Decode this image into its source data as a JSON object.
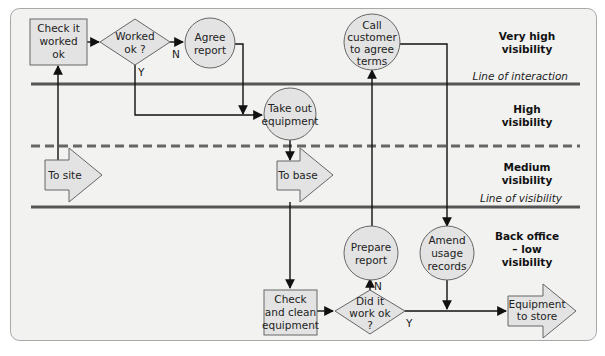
{
  "colors": {
    "panel_bg": "#f2f2f1",
    "panel_border": "#a8a8a8",
    "shape_fill": "#e3e3e3",
    "shape_stroke": "#666666",
    "line": "#555555",
    "connector": "#111111"
  },
  "zones": [
    {
      "id": "very-high",
      "lines": [
        "Very high",
        "visibility"
      ]
    },
    {
      "id": "high",
      "lines": [
        "High",
        "visibility"
      ]
    },
    {
      "id": "medium",
      "lines": [
        "Medium",
        "visibility"
      ]
    },
    {
      "id": "back-office",
      "lines": [
        "Back office",
        "– low",
        "visibility"
      ]
    }
  ],
  "boundaries": {
    "interaction": "Line of interaction",
    "visibility": "Line of visibility"
  },
  "nodes": {
    "check_worked": {
      "shape": "box",
      "lines": [
        "Check it",
        "worked",
        "ok"
      ]
    },
    "worked_ok": {
      "shape": "diamond",
      "lines": [
        "Worked",
        "ok ?"
      ]
    },
    "agree_report": {
      "shape": "circle",
      "lines": [
        "Agree",
        "report"
      ]
    },
    "call_customer": {
      "shape": "circle",
      "lines": [
        "Call",
        "customer",
        "to agree",
        "terms"
      ]
    },
    "take_out": {
      "shape": "circle",
      "lines": [
        "Take out",
        "equipment"
      ]
    },
    "to_site": {
      "shape": "arrow",
      "lines": [
        "To site"
      ]
    },
    "to_base": {
      "shape": "arrow",
      "lines": [
        "To base"
      ]
    },
    "prepare_report": {
      "shape": "circle",
      "lines": [
        "Prepare",
        "report"
      ]
    },
    "amend_usage": {
      "shape": "circle",
      "lines": [
        "Amend",
        "usage",
        "records"
      ]
    },
    "check_clean": {
      "shape": "box",
      "lines": [
        "Check",
        "and clean",
        "equipment"
      ]
    },
    "did_it_work": {
      "shape": "diamond",
      "lines": [
        "Did it",
        "work ok",
        "?"
      ]
    },
    "to_store": {
      "shape": "arrow",
      "lines": [
        "Equipment",
        "to store"
      ]
    }
  },
  "branch_labels": {
    "worked_no": "N",
    "worked_yes": "Y",
    "did_no": "N",
    "did_yes": "Y"
  }
}
